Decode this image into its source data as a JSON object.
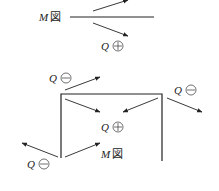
{
  "top_diagram": {
    "moment_label": {
      "var": "M",
      "suffix": "図"
    },
    "shear_label": {
      "var": "Q",
      "sign": "plus"
    }
  },
  "frame_diagram": {
    "shear_labels": [
      {
        "id": "top-left",
        "var": "Q",
        "sign": "minus"
      },
      {
        "id": "top-right",
        "var": "Q",
        "sign": "minus"
      },
      {
        "id": "center",
        "var": "Q",
        "sign": "plus"
      },
      {
        "id": "bottom-left",
        "var": "Q",
        "sign": "minus"
      }
    ],
    "moment_label": {
      "var": "M",
      "suffix": "図"
    }
  }
}
